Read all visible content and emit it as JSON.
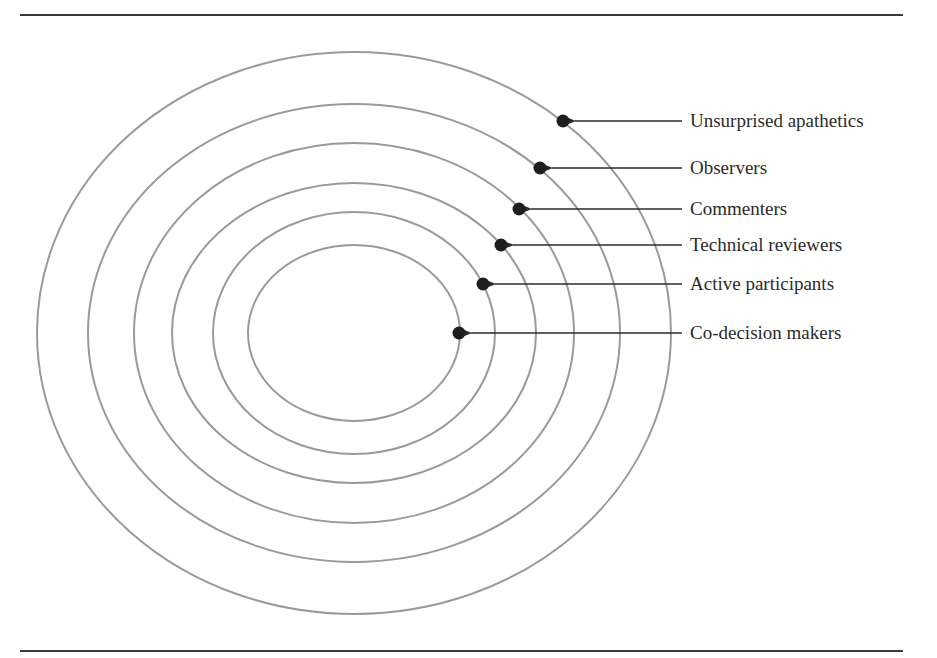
{
  "diagram": {
    "type": "concentric-ellipses",
    "center": {
      "x": 354,
      "y": 333
    },
    "rings": [
      {
        "name": "Co-decision makers",
        "rx": 106,
        "ry": 88,
        "dot": {
          "x": 459,
          "y": 333
        },
        "label_y": 333
      },
      {
        "name": "Active participants",
        "rx": 141,
        "ry": 121,
        "dot": {
          "x": 483,
          "y": 284
        },
        "label_y": 284
      },
      {
        "name": "Technical reviewers",
        "rx": 182,
        "ry": 150,
        "dot": {
          "x": 501,
          "y": 245
        },
        "label_y": 245
      },
      {
        "name": "Commenters",
        "rx": 220,
        "ry": 190,
        "dot": {
          "x": 519,
          "y": 209
        },
        "label_y": 209
      },
      {
        "name": "Observers",
        "rx": 266,
        "ry": 229,
        "dot": {
          "x": 540,
          "y": 168
        },
        "label_y": 168
      },
      {
        "name": "Unsurprised apathetics",
        "rx": 317,
        "ry": 281,
        "dot": {
          "x": 563,
          "y": 121
        },
        "label_y": 121
      }
    ],
    "colors": {
      "ring": "#9a9a9a",
      "dot": "#1e1e1e",
      "arrow": "#2b2b2b",
      "rule": "#3a3a3a",
      "text": "#2b2b2b"
    }
  },
  "labels": {
    "l0": "Co-decision makers",
    "l1": "Active participants",
    "l2": "Technical reviewers",
    "l3": "Commenters",
    "l4": "Observers",
    "l5": "Unsurprised apathetics"
  }
}
